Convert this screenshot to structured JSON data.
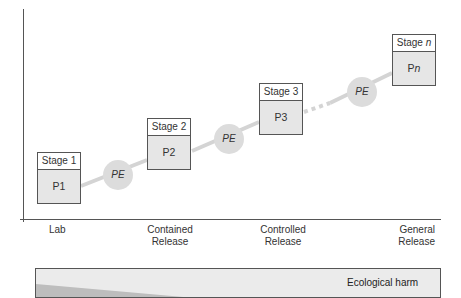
{
  "diagram": {
    "stages": [
      {
        "header": "Stage 1",
        "header_prefix": "Stage ",
        "header_suffix": "1",
        "body": "P1",
        "body_prefix": "P",
        "body_suffix": "1"
      },
      {
        "header": "Stage 2",
        "header_prefix": "Stage ",
        "header_suffix": "2",
        "body": "P2",
        "body_prefix": "P",
        "body_suffix": "2"
      },
      {
        "header": "Stage 3",
        "header_prefix": "Stage ",
        "header_suffix": "3",
        "body": "P3",
        "body_prefix": "P",
        "body_suffix": "3"
      },
      {
        "header": "Stage n",
        "header_prefix": "Stage ",
        "header_suffix": "n",
        "body": "Pn",
        "body_prefix": "P",
        "body_suffix": "n"
      }
    ],
    "connectors": [
      {
        "label": "PE"
      },
      {
        "label": "PE"
      },
      {
        "label": "PE"
      }
    ],
    "x_axis": {
      "labels": [
        {
          "line1": "Lab",
          "line2": ""
        },
        {
          "line1": "Contained",
          "line2": "Release"
        },
        {
          "line1": "Controlled",
          "line2": "Release"
        },
        {
          "line1": "General",
          "line2": "Release"
        }
      ]
    },
    "bottom_panel": {
      "label": "Ecological harm"
    },
    "colors": {
      "box_fill": "#e6e6e6",
      "box_border": "#555555",
      "pe_fill": "#dcdcdc",
      "link": "#d4d4d4",
      "axis": "#555555",
      "panel_fill": "#ebebeb",
      "panel_wedge": "#bdbdbd"
    }
  }
}
